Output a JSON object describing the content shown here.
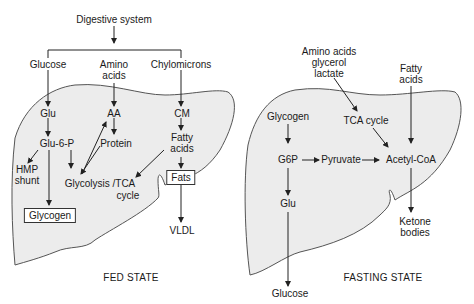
{
  "fed": {
    "source": "Digestive system",
    "inputs": {
      "glucose": "Glucose",
      "amino": "Amino",
      "amino2": "acids",
      "chylo": "Chylomicrons"
    },
    "glu": "Glu",
    "aa": "AA",
    "cm": "CM",
    "g6p": "Glu-6-P",
    "protein": "Protein",
    "fatty1": "Fatty",
    "fatty2": "acids",
    "hmp1": "HMP",
    "hmp2": "shunt",
    "glycolysis": "Glycolysis /TCA",
    "cycle": "cycle",
    "fats": "Fats",
    "glycogen": "Glycogen",
    "vldl": "VLDL",
    "title": "FED STATE"
  },
  "fasting": {
    "inputs": {
      "aa1": "Amino acids",
      "aa2": "glycerol",
      "aa3": "lactate",
      "fa1": "Fatty",
      "fa2": "acids"
    },
    "glycogen": "Glycogen",
    "tca": "TCA cycle",
    "g6p": "G6P",
    "pyruvate": "Pyruvate",
    "acetyl": "Acetyl-CoA",
    "glu": "Glu",
    "ketone1": "Ketone",
    "ketone2": "bodies",
    "glucose": "Glucose",
    "title": "FASTING STATE"
  },
  "colors": {
    "liver_fill": "#ececec",
    "liver_stroke": "#555555",
    "arrow": "#222222"
  }
}
